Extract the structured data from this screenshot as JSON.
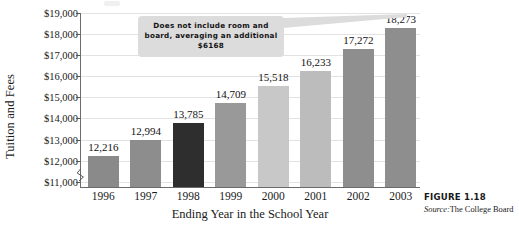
{
  "chart_data": {
    "type": "bar",
    "title": "",
    "subtitle": "",
    "xlabel": "Ending Year in the School Year",
    "ylabel": "Tuition and Fees",
    "categories": [
      "1996",
      "1997",
      "1998",
      "1999",
      "2000",
      "2001",
      "2002",
      "2003"
    ],
    "values": [
      12216,
      12994,
      13785,
      14709,
      15518,
      16233,
      17272,
      18273
    ],
    "data_labels": [
      "12,216",
      "12,994",
      "13,785",
      "14,709",
      "15,518",
      "16,233",
      "17,272",
      "18,273"
    ],
    "ylim": [
      10700,
      19000
    ],
    "ytick_values": [
      11000,
      12000,
      13000,
      14000,
      15000,
      16000,
      17000,
      18000,
      19000
    ],
    "ytick_labels": [
      "$11,000",
      "$12,000",
      "$13,000",
      "$14,000",
      "$15,000",
      "$16,000",
      "$17,000",
      "$18,000",
      "$19,000"
    ],
    "grid": true,
    "grid_axis": "y",
    "legend": false,
    "legend_position": "none",
    "y_axis_break": true,
    "bar_colors": [
      "#8a8a8a",
      "#8d8d8d",
      "#2e2e2e",
      "#999999",
      "#c8c8c8",
      "#bcbcbc",
      "#8e8e8e",
      "#8e8e8e"
    ],
    "annotations": [
      {
        "name": "room-and-board-callout",
        "line1": "Does not include room and",
        "line2": "board, averaging an additional $6168",
        "points_to": "2003",
        "background": "#dcdcdc"
      }
    ]
  },
  "callout": {
    "line1": "Does not include room and",
    "line2": "board, averaging an additional $6168"
  },
  "caption": {
    "figure_number": "FIGURE 1.18",
    "source_label": "Source:",
    "source_value": "The College Board"
  },
  "colors": {
    "axis": "#6b6b6b",
    "gridline": "#e2e2e2",
    "text": "#1a1a1a",
    "callout_bg": "#dcdcdc"
  }
}
